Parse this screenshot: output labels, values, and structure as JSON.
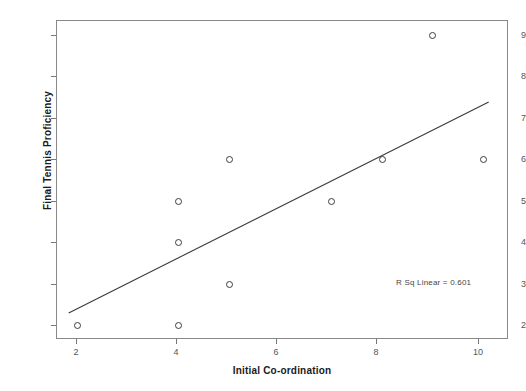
{
  "chart_data": {
    "type": "scatter",
    "title": "",
    "xlabel": "Initial Co-ordination",
    "ylabel": "Final Tennis Proficiency",
    "xlim": [
      1.6,
      10.5
    ],
    "ylim": [
      1.65,
      9.35
    ],
    "xticks": [
      2,
      4,
      6,
      8,
      10
    ],
    "yticks": [
      2,
      3,
      4,
      5,
      6,
      7,
      8,
      9
    ],
    "xtick_labels": [
      "2",
      "4",
      "6",
      "8",
      "10"
    ],
    "ytick_labels": [
      "2",
      "3",
      "4",
      "5",
      "6",
      "7",
      "8",
      "9"
    ],
    "grid": false,
    "legend": null,
    "marker": "open-circle",
    "points": [
      {
        "x": 2,
        "y": 2
      },
      {
        "x": 4,
        "y": 2
      },
      {
        "x": 4,
        "y": 4
      },
      {
        "x": 4,
        "y": 5
      },
      {
        "x": 5,
        "y": 3
      },
      {
        "x": 5,
        "y": 6
      },
      {
        "x": 7,
        "y": 5
      },
      {
        "x": 8,
        "y": 6
      },
      {
        "x": 9,
        "y": 9
      },
      {
        "x": 10,
        "y": 6
      }
    ],
    "fit_line": {
      "type": "linear",
      "x_start": 1.85,
      "y_start": 2.28,
      "x_end": 10.12,
      "y_end": 7.37
    },
    "annotations": [
      {
        "name": "r-squared",
        "text": "R Sq Linear = 0.601",
        "x": 9.0,
        "y": 2.85
      }
    ],
    "colors": {
      "frame": "#888888",
      "marker_stroke": "#3d3d3d",
      "fit_line": "#3a3a3a",
      "tick_label": "#555555",
      "axis_title": "#1a1a1a",
      "background": "#ffffff"
    }
  }
}
